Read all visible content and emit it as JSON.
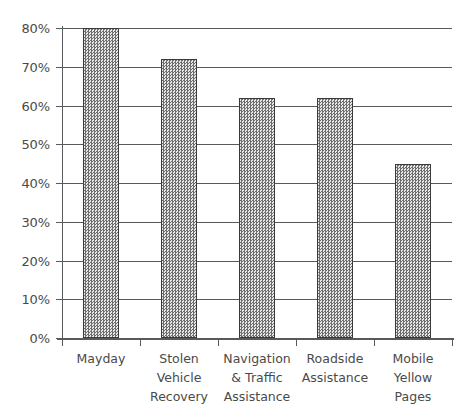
{
  "chart_data": {
    "type": "bar",
    "title": "",
    "subtitle": "",
    "xlabel": "",
    "ylabel": "",
    "categories": [
      "Mayday",
      "Stolen\nVehicle\nRecovery",
      "Navigation\n& Traffic\nAssistance",
      "Roadside\nAssistance",
      "Mobile\nYellow\nPages"
    ],
    "values": [
      80,
      72,
      62,
      62,
      45
    ],
    "ylim": [
      0,
      80
    ],
    "ytick_values": [
      0,
      10,
      20,
      30,
      40,
      50,
      60,
      70,
      80
    ],
    "ytick_labels": [
      "0%",
      "10%",
      "20%",
      "30%",
      "40%",
      "50%",
      "60%",
      "70%",
      "80%"
    ],
    "grid": true,
    "grid_axis": "y",
    "legend": false,
    "legend_position": "none",
    "value_suffix": "%",
    "colors": {
      "bar_fill": "#d4d4d4",
      "bar_pattern": "#6e6e6e",
      "bar_border": "#3a3a3a",
      "gridline": "#58595b",
      "axis": "#58595b",
      "tick_text": "#4a4a4a",
      "background": "#ffffff"
    }
  }
}
